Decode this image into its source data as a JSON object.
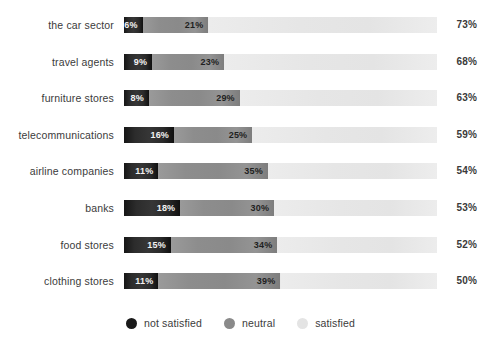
{
  "chart_data": {
    "type": "bar",
    "subtype": "stacked-horizontal-100pct",
    "title": "",
    "subtitle": "",
    "xlabel": "",
    "ylabel": "",
    "xlim": [
      0,
      100
    ],
    "grid": false,
    "legend_position": "bottom-center",
    "value_suffix": "%",
    "categories": [
      "the car sector",
      "travel agents",
      "furniture stores",
      "telecommunications",
      "airline companies",
      "banks",
      "food stores",
      "clothing stores"
    ],
    "series": [
      {
        "name": "not satisfied",
        "color": "#222222",
        "values": [
          6,
          9,
          8,
          16,
          11,
          18,
          15,
          11
        ]
      },
      {
        "name": "neutral",
        "color": "#8d8d8d",
        "values": [
          21,
          23,
          29,
          25,
          35,
          30,
          34,
          39
        ]
      },
      {
        "name": "satisfied",
        "color": "#e7e7e7",
        "values": [
          73,
          68,
          63,
          59,
          54,
          53,
          52,
          50
        ]
      }
    ],
    "rows": [
      {
        "label": "the car sector",
        "not_satisfied": "6%",
        "neutral": "21%",
        "satisfied": "73%"
      },
      {
        "label": "travel agents",
        "not_satisfied": "9%",
        "neutral": "23%",
        "satisfied": "68%"
      },
      {
        "label": "furniture stores",
        "not_satisfied": "8%",
        "neutral": "29%",
        "satisfied": "63%"
      },
      {
        "label": "telecommunications",
        "not_satisfied": "16%",
        "neutral": "25%",
        "satisfied": "59%"
      },
      {
        "label": "airline companies",
        "not_satisfied": "11%",
        "neutral": "35%",
        "satisfied": "54%"
      },
      {
        "label": "banks",
        "not_satisfied": "18%",
        "neutral": "30%",
        "satisfied": "53%"
      },
      {
        "label": "food stores",
        "not_satisfied": "15%",
        "neutral": "34%",
        "satisfied": "52%"
      },
      {
        "label": "clothing stores",
        "not_satisfied": "11%",
        "neutral": "39%",
        "satisfied": "50%"
      }
    ],
    "legend": [
      {
        "label": "not satisfied",
        "color": "#1a1a1a"
      },
      {
        "label": "neutral",
        "color": "#8a8a8a"
      },
      {
        "label": "satisfied",
        "color": "#e4e4e4"
      }
    ]
  },
  "layout": {
    "track_left_px": 124,
    "track_width_px": 313,
    "row_top_px": 14,
    "row_step_px": 36.6
  }
}
